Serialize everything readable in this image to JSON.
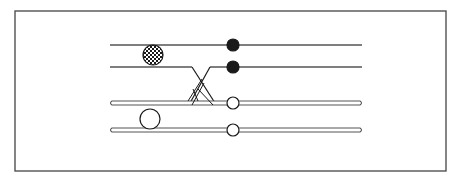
{
  "figure": {
    "colors": {
      "ink": "#1a1a1a",
      "line": "#555555",
      "frame": "#444444",
      "background": "#ffffff"
    },
    "frame": {
      "x": 15,
      "y": 11,
      "width": 431,
      "height": 160
    },
    "strands": [
      {
        "id": "chromatid-1",
        "y": 45,
        "style": "single",
        "x1": 110,
        "x2": 362
      },
      {
        "id": "chromatid-2",
        "y": 67,
        "style": "single",
        "x1": 110,
        "x2": 362
      },
      {
        "id": "chromatid-3",
        "y": 103,
        "style": "double",
        "x1": 110,
        "x2": 362
      },
      {
        "id": "chromatid-4",
        "y": 130,
        "style": "double",
        "x1": 110,
        "x2": 362
      }
    ],
    "centromeres": [
      {
        "id": "centromere-1",
        "cx": 233,
        "cy": 45,
        "r": 6,
        "fill": "solid"
      },
      {
        "id": "centromere-2",
        "cx": 233,
        "cy": 67,
        "r": 6,
        "fill": "solid"
      },
      {
        "id": "centromere-3",
        "cx": 233,
        "cy": 103,
        "r": 6,
        "fill": "open"
      },
      {
        "id": "centromere-4",
        "cx": 233,
        "cy": 130,
        "r": 6,
        "fill": "open"
      }
    ],
    "markers": [
      {
        "id": "hatched-marker",
        "cx": 153,
        "cy": 55,
        "r": 10,
        "fill": "crosshatch"
      },
      {
        "id": "open-marker",
        "cx": 150,
        "cy": 119,
        "r": 10,
        "fill": "open"
      }
    ],
    "crossover": {
      "x_left": 192,
      "x_right": 215,
      "y_top": 67,
      "y_bottom": 103
    }
  }
}
